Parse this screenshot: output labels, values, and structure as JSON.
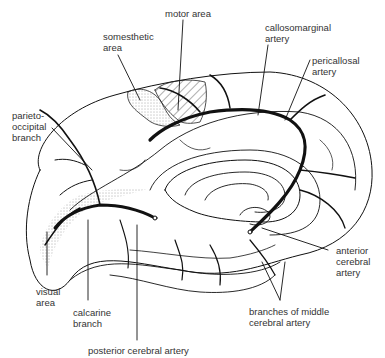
{
  "figure": {
    "page_marker": "",
    "labels": {
      "motor_area": "motor area",
      "somesthetic_area": "somesthetic\narea",
      "callosomarginal_artery": "callosomarginal\nartery",
      "pericallosal_artery": "pericallosal\nartery",
      "parieto_occipital_branch": "parieto-\noccipital\nbranch",
      "anterior_cerebral_artery": "anterior\ncerebral\nartery",
      "visual_area": "visual\narea",
      "calcarine_branch": "calcarine\nbranch",
      "branches_middle_cerebral": "branches of middle\ncerebral artery",
      "posterior_cerebral_artery": "posterior cerebral artery"
    }
  }
}
